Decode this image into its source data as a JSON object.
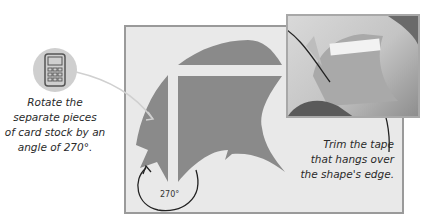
{
  "captions": {
    "rotate": "Rotate the separate pieces of card stock by an angle of 270°.",
    "rotate_lines": [
      "Rotate the",
      "separate pieces",
      "of card stock by an",
      "angle of 270°."
    ],
    "trim_lines": [
      "Trim the tape",
      "that hangs over",
      "the shape's edge."
    ]
  },
  "angle_label": "270°",
  "icons": {
    "calculator": "calculator-icon"
  },
  "colors": {
    "panel_bg": "#e9e9e9",
    "panel_border": "#9a9a9a",
    "shape_fill": "#8a8a8a",
    "arrow": "#222222",
    "pointer_line": "#cfcfcf"
  }
}
